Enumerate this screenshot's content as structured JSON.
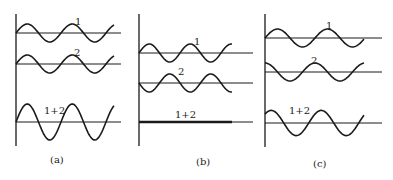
{
  "figure": {
    "colors": {
      "ink": "#1a1a1a",
      "background": "#ffffff"
    },
    "panels": [
      {
        "id": "a",
        "caption": "(a)",
        "waves": [
          {
            "label": "1",
            "amplitude": 1,
            "phase_deg": 0
          },
          {
            "label": "2",
            "amplitude": 1,
            "phase_deg": 0
          },
          {
            "label": "1+2",
            "amplitude": 2,
            "phase_deg": 0
          }
        ]
      },
      {
        "id": "b",
        "caption": "(b)",
        "waves": [
          {
            "label": "1",
            "amplitude": 1,
            "phase_deg": 0
          },
          {
            "label": "2",
            "amplitude": 1,
            "phase_deg": 180
          },
          {
            "label": "1+2",
            "amplitude": 0,
            "phase_deg": 0
          }
        ]
      },
      {
        "id": "c",
        "caption": "(c)",
        "waves": [
          {
            "label": "1",
            "amplitude": 1,
            "phase_deg": 0
          },
          {
            "label": "2",
            "amplitude": 1,
            "phase_deg": 90
          },
          {
            "label": "1+2",
            "amplitude": 1.4,
            "phase_deg": 45
          }
        ]
      }
    ]
  }
}
